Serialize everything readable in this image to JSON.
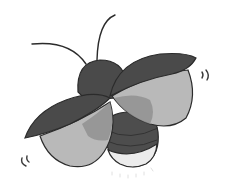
{
  "illustration": {
    "subject": "firefly",
    "alt": "Grayscale illustration of a flying firefly with open wings and glowing tail",
    "colors": {
      "background": "#ffffff",
      "outline": "#2b2b2b",
      "elytra": "#4a4a4a",
      "hindwing": "#b9b9b9",
      "hindwing_overlap": "#8f8f8f",
      "abdomen_dark": "#4d4d4d",
      "abdomen_stripe": "#3a3a3a",
      "glow_tail": "#ececec",
      "motion_marks": "#3a3a3a"
    },
    "icons": [
      "antenna",
      "head",
      "left-elytron",
      "right-elytron",
      "left-hindwing",
      "right-hindwing",
      "abdomen",
      "glowing-tail",
      "motion-marks"
    ]
  }
}
